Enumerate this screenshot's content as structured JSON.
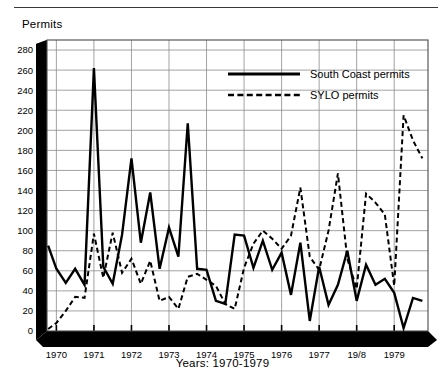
{
  "figure": {
    "y_axis_title": "Permits",
    "x_axis_title": "Years: 1970-1979"
  },
  "legend": {
    "items": [
      {
        "label": "South Coast permits",
        "style": "solid",
        "color": "#000000"
      },
      {
        "label": "SYLO permits",
        "style": "dashed",
        "color": "#000000"
      }
    ]
  },
  "chart_data": {
    "type": "line",
    "title": "",
    "xlabel": "Years: 1970-1979",
    "ylabel": "Permits",
    "ylim": [
      0,
      290
    ],
    "xlim": [
      1969.75,
      1979.9
    ],
    "grid": true,
    "legend_position": "top-center",
    "ytick_labels": [
      "0",
      "20",
      "40",
      "60",
      "80",
      "100",
      "120",
      "140",
      "160",
      "180",
      "200",
      "220",
      "240",
      "260",
      "280"
    ],
    "yticks": [
      0,
      20,
      40,
      60,
      80,
      100,
      120,
      140,
      160,
      180,
      200,
      220,
      240,
      260,
      280
    ],
    "xtick_labels": [
      "1970",
      "1971",
      "1972",
      "1973",
      "1974",
      "1975",
      "1976",
      "1977",
      "19/8",
      "1979"
    ],
    "xticks": [
      1970,
      1971,
      1972,
      1973,
      1974,
      1975,
      1976,
      1977,
      1978,
      1979
    ],
    "minor_ticks_per_year": 4,
    "x": [
      1969.78,
      1970.0,
      1970.25,
      1970.5,
      1970.75,
      1971.0,
      1971.25,
      1971.5,
      1971.75,
      1972.0,
      1972.25,
      1972.5,
      1972.75,
      1973.0,
      1973.25,
      1973.5,
      1973.75,
      1974.0,
      1974.25,
      1974.5,
      1974.75,
      1975.0,
      1975.25,
      1975.5,
      1975.75,
      1976.0,
      1976.25,
      1976.5,
      1976.75,
      1977.0,
      1977.25,
      1977.5,
      1977.75,
      1978.0,
      1978.25,
      1978.5,
      1978.75,
      1979.0,
      1979.25,
      1979.5,
      1979.75
    ],
    "series": [
      {
        "name": "South Coast permits",
        "style": "solid",
        "color": "#000000",
        "values": [
          85,
          62,
          48,
          62,
          46,
          262,
          64,
          47,
          96,
          172,
          88,
          138,
          62,
          103,
          74,
          207,
          62,
          61,
          30,
          27,
          96,
          95,
          63,
          90,
          61,
          78,
          36,
          88,
          10,
          64,
          26,
          46,
          80,
          30,
          66,
          46,
          52,
          38,
          3,
          33,
          30
        ]
      },
      {
        "name": "SYLO permits",
        "style": "dashed",
        "color": "#000000",
        "values": [
          2,
          8,
          20,
          34,
          33,
          97,
          53,
          98,
          58,
          72,
          47,
          70,
          30,
          34,
          22,
          54,
          57,
          51,
          45,
          27,
          22,
          63,
          87,
          100,
          92,
          82,
          95,
          143,
          74,
          61,
          100,
          157,
          72,
          42,
          137,
          128,
          116,
          45,
          215,
          190,
          172
        ]
      }
    ]
  }
}
